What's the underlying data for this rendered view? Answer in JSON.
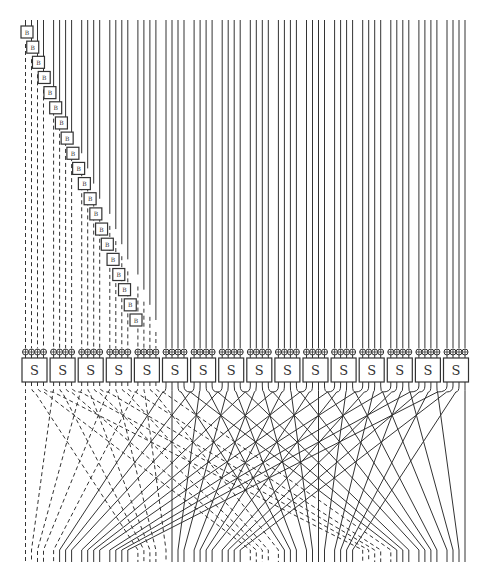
{
  "diagram": {
    "type": "substitution-permutation network",
    "canvas": {
      "width": 490,
      "height": 582
    },
    "colors": {
      "line": "#333333",
      "box_stroke": "#333333",
      "box_fill": "#ffffff",
      "background": "#ffffff"
    },
    "wires": {
      "count": 64,
      "top_y": 20,
      "xor_row_y": 352,
      "bottom_y": 562
    },
    "b_boxes": {
      "label": "B",
      "count": 20,
      "first_x": 27,
      "first_y": 32,
      "last_x": 136,
      "last_y": 320
    },
    "xor_symbol": "⊕",
    "s_boxes": {
      "label": "S",
      "count": 16,
      "first_x": 22,
      "pitch": 28.1,
      "y": 358,
      "width": 25,
      "height": 24
    },
    "dashed_inputs": 20,
    "permutation": "perfect-shuffle: output j of S-box i goes to wire 16*j + i"
  }
}
